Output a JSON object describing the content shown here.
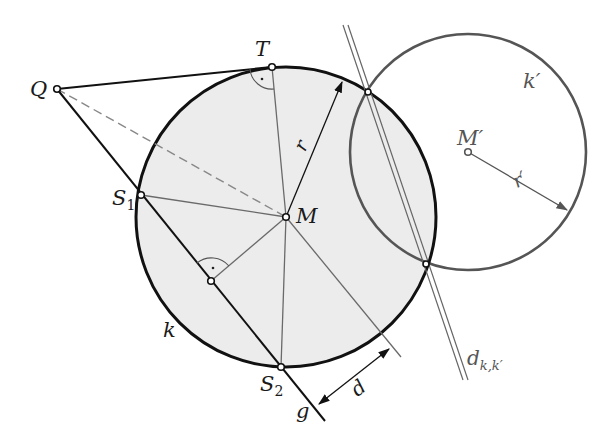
{
  "diagram": {
    "type": "geometry",
    "colors": {
      "circle_k_fill": "#ededed",
      "circle_k_stroke": "#111111",
      "circle_k2_stroke": "#555555",
      "thin_line": "#6a6a6a",
      "thick_line": "#111111",
      "radical_axis": "#666666"
    },
    "circle_k": {
      "cx": 286,
      "cy": 217,
      "r": 150,
      "label": "k"
    },
    "circle_k2": {
      "cx": 468,
      "cy": 152,
      "r": 118,
      "label": "k′"
    },
    "points": {
      "Q": {
        "x": 57,
        "y": 89,
        "label": "Q"
      },
      "T": {
        "x": 272,
        "y": 67,
        "label": "T"
      },
      "M": {
        "x": 286,
        "y": 217,
        "label": "M"
      },
      "S1": {
        "x": 141,
        "y": 195,
        "label": "S",
        "sub": "1"
      },
      "S2": {
        "x": 281,
        "y": 367,
        "label": "S",
        "sub": "2"
      },
      "F": {
        "x": 211,
        "y": 281
      },
      "M2": {
        "x": 468,
        "y": 152,
        "label": "M′"
      },
      "P1": {
        "x": 368,
        "y": 92
      },
      "P2": {
        "x": 426,
        "y": 264
      }
    },
    "labels": {
      "radius": "r",
      "radius2": "r′",
      "distance": "d",
      "line_g": "g",
      "radical_axis": "d",
      "radical_axis_sub": "k,k′",
      "right_angle_marker": "·"
    }
  }
}
